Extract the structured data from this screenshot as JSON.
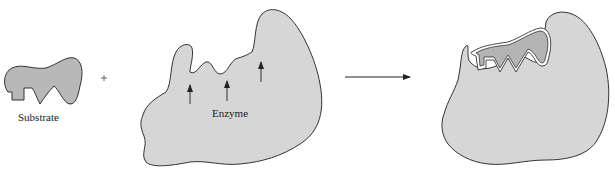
{
  "diagram": {
    "type": "lock-and-key enzyme model",
    "colors": {
      "shape_fill": "#d6d6d6",
      "substrate_fill": "#b4b4b4",
      "outline": "#333333",
      "background": "#ffffff"
    },
    "substrate": {
      "label": "Substrate"
    },
    "operator": {
      "symbol": "+"
    },
    "enzyme": {
      "label": "Enzyme",
      "active_site_arrows": 3
    },
    "reaction_arrow": {
      "direction": "right"
    },
    "complex": {
      "description": "Enzyme-substrate complex"
    }
  }
}
